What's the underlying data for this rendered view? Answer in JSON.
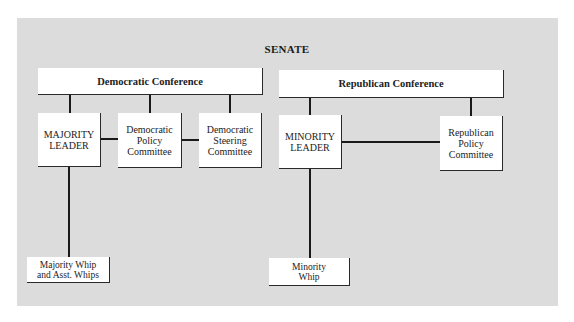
{
  "diagram": {
    "title": "SENATE",
    "democratic": {
      "conference": "Democratic Conference",
      "majority_leader": "MAJORITY\nLEADER",
      "policy_committee": "Democratic\nPolicy\nCommittee",
      "steering_committee": "Democratic\nSteering\nCommittee",
      "whip": "Majority Whip\nand Asst. Whips"
    },
    "republican": {
      "conference": "Republican Conference",
      "minority_leader": "MINORITY\nLEADER",
      "policy_committee": "Republican\nPolicy\nCommittee",
      "whip": "Minority\nWhip"
    },
    "colors": {
      "background": "#dcdcdc",
      "box": "#ffffff",
      "line": "#1a1a1a"
    }
  }
}
